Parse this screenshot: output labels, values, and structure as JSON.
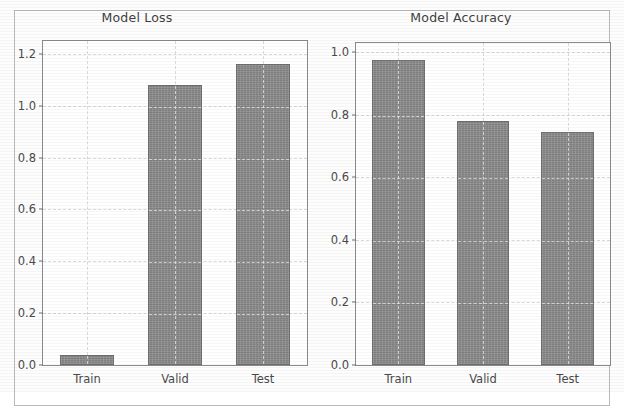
{
  "figure": {
    "background_color": "#ffffff",
    "bar_color": "#8d8d8d",
    "bar_edge_color": "#6f6f6f",
    "grid_color": "#d8d8d8",
    "axis_color": "#8a8a8a",
    "text_color": "#4a4a4a"
  },
  "chart_data": [
    {
      "type": "bar",
      "title": "Model Loss",
      "xlabel": "",
      "ylabel": "",
      "categories": [
        "Train",
        "Valid",
        "Test"
      ],
      "values": [
        0.04,
        1.08,
        1.16
      ],
      "ylim": [
        0.0,
        1.25
      ],
      "yticks": [
        0.0,
        0.2,
        0.4,
        0.6,
        0.8,
        1.0,
        1.2
      ],
      "ytick_labels": [
        "0.0",
        "0.2",
        "0.4",
        "0.6",
        "0.8",
        "1.0",
        "1.2"
      ],
      "grid": true,
      "legend": false
    },
    {
      "type": "bar",
      "title": "Model Accuracy",
      "xlabel": "",
      "ylabel": "",
      "categories": [
        "Train",
        "Valid",
        "Test"
      ],
      "values": [
        0.975,
        0.78,
        0.745
      ],
      "ylim": [
        0.0,
        1.03
      ],
      "yticks": [
        0.0,
        0.2,
        0.4,
        0.6,
        0.8,
        1.0
      ],
      "ytick_labels": [
        "0.0",
        "0.2",
        "0.4",
        "0.6",
        "0.8",
        "1.0"
      ],
      "grid": true,
      "legend": false
    }
  ]
}
